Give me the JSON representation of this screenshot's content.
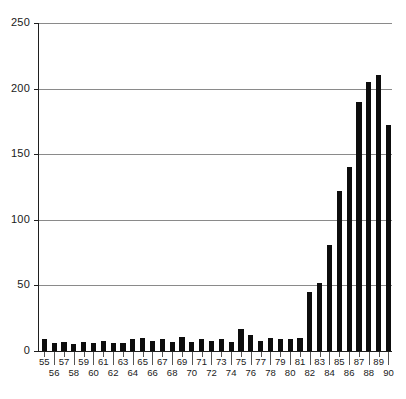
{
  "chart_data": {
    "type": "bar",
    "title": "",
    "subtitle": "",
    "xlabel": "",
    "ylabel": "",
    "categories": [
      "55",
      "56",
      "57",
      "58",
      "59",
      "60",
      "61",
      "62",
      "63",
      "64",
      "65",
      "66",
      "67",
      "68",
      "69",
      "70",
      "71",
      "72",
      "73",
      "74",
      "75",
      "76",
      "77",
      "78",
      "79",
      "80",
      "81",
      "82",
      "83",
      "84",
      "85",
      "86",
      "87",
      "88",
      "89",
      "90"
    ],
    "values": [
      9,
      6,
      7,
      5,
      7,
      6,
      8,
      6,
      6,
      9,
      10,
      8,
      9,
      7,
      11,
      7,
      9,
      8,
      9,
      7,
      17,
      12,
      8,
      10,
      9,
      9,
      10,
      45,
      52,
      81,
      122,
      140,
      190,
      205,
      210,
      172
    ],
    "ylim": [
      0,
      250
    ],
    "yticks": [
      0,
      50,
      100,
      150,
      200,
      250
    ],
    "ytick_labels": [
      "0",
      "50",
      "100",
      "150",
      "200",
      "250"
    ],
    "grid": true,
    "grid_axis": "y",
    "legend": null,
    "bar_color": "#0d0d0d",
    "grid_color": "#8a8a8a",
    "axis_color": "#1f1f1f",
    "background": "#ffffff",
    "xtick_label_stagger": true
  }
}
